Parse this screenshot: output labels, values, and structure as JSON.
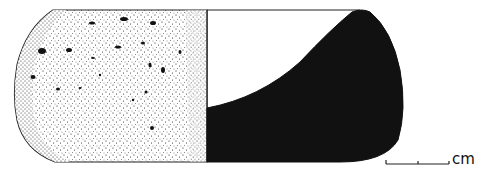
{
  "figure": {
    "exterior_fill": "stipple",
    "section_fill": "#111111",
    "outline_color": "#222222"
  },
  "scale_bar": {
    "unit_label": "cm"
  }
}
